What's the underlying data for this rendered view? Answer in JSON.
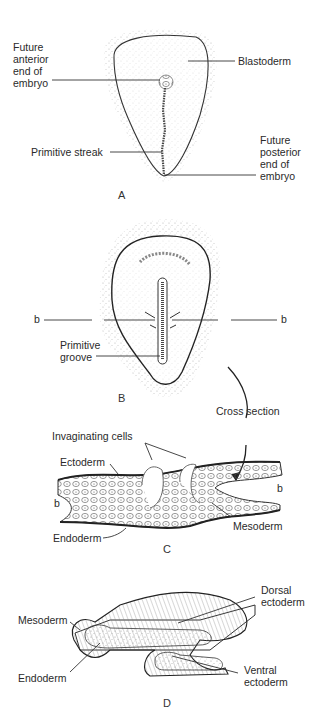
{
  "figure": {
    "panels": [
      {
        "id": "A",
        "letter": "A"
      },
      {
        "id": "B",
        "letter": "B"
      },
      {
        "id": "C",
        "letter": "C"
      },
      {
        "id": "D",
        "letter": "D"
      }
    ]
  },
  "panel_a": {
    "labels": {
      "anterior": "Future\nanterior\nend of\nembryo",
      "blastoderm": "Blastoderm",
      "primitive_streak": "Primitive streak",
      "posterior": "Future\nposterior\nend of\nembryo"
    }
  },
  "panel_b": {
    "labels": {
      "b_left": "b",
      "b_right": "b",
      "primitive_groove": "Primitive\ngroove",
      "cross_section": "Cross section"
    }
  },
  "panel_c": {
    "labels": {
      "invaginating_cells": "Invaginating cells",
      "ectoderm": "Ectoderm",
      "b_left": "b",
      "b_right": "b",
      "mesoderm": "Mesoderm",
      "endoderm": "Endoderm"
    }
  },
  "panel_d": {
    "labels": {
      "dorsal_ectoderm": "Dorsal\nectoderm",
      "mesoderm": "Mesoderm",
      "endoderm": "Endoderm",
      "ventral_ectoderm": "Ventral\nectoderm"
    }
  },
  "colors": {
    "ink": "#2a2a2a",
    "stipple": "#9a9a9a",
    "background": "#ffffff"
  }
}
